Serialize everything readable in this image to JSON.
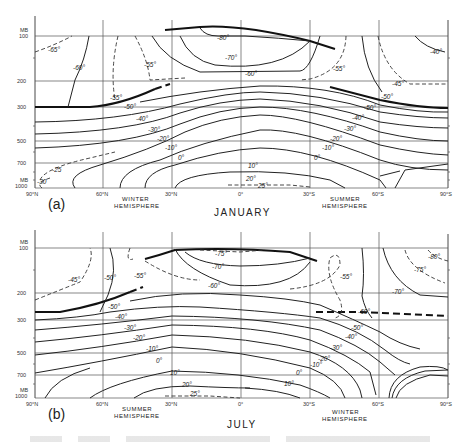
{
  "figure": {
    "type": "meridional temperature cross-section",
    "panels": [
      {
        "id": "a",
        "panel_label": "(a)",
        "month": "JANUARY",
        "left_hemisphere_label": [
          "WINTER",
          "HEMISPHERE"
        ],
        "right_hemisphere_label": [
          "SUMMER",
          "HEMISPHERE"
        ],
        "pressure_unit": "MB",
        "pressure_ticks": [
          "100",
          "200",
          "300",
          "500",
          "700",
          "1000"
        ],
        "pressure_unit_bottom": "MB",
        "latitude_ticks": [
          "90°N",
          "60°N",
          "30°N",
          "0°",
          "30°S",
          "60°S",
          "90°S"
        ],
        "contour_labels": [
          "-65°",
          "-60°",
          "-55°",
          "-55°",
          "-80°",
          "-70°",
          "-60°",
          "-55°",
          "-40°",
          "-45°",
          "-50°",
          "-50°",
          "-50°",
          "-40°",
          "-30°",
          "-20°",
          "-10°",
          "0°",
          "-25",
          "-30",
          "-40°",
          "-30°",
          "-20°",
          "-10°",
          "0°",
          "10°",
          "20°",
          "25°"
        ]
      },
      {
        "id": "b",
        "panel_label": "(b)",
        "month": "JULY",
        "left_hemisphere_label": [
          "SUMMER",
          "HEMISPHERE"
        ],
        "right_hemisphere_label": [
          "WINTER",
          "HEMISPHERE"
        ],
        "pressure_unit": "MB",
        "pressure_ticks": [
          "100",
          "200",
          "300",
          "500",
          "700",
          "1000"
        ],
        "pressure_unit_bottom": "MB",
        "latitude_ticks": [
          "90°N",
          "60°N",
          "30°N",
          "0°",
          "30°S",
          "60°S",
          "90°S"
        ],
        "contour_labels": [
          "-45°",
          "-50°",
          "-55°",
          "-75°",
          "-70°",
          "-60°",
          "-55°",
          "-80°",
          "-75°",
          "-70°",
          "-60°",
          "-50°",
          "-40°",
          "-30°",
          "-20°",
          "-10°",
          "0°",
          "10°",
          "20°",
          "25°",
          "-50°",
          "-40°",
          "-30°",
          "-20°",
          "-10°",
          "0°",
          "10°"
        ]
      }
    ]
  },
  "labels": {
    "a": {
      "panel": "(a)",
      "month": "JANUARY",
      "hemi_left_1": "WINTER",
      "hemi_left_2": "HEMISPHERE",
      "hemi_right_1": "SUMMER",
      "hemi_right_2": "HEMISPHERE",
      "mb_top": "MB",
      "mb_bottom": "MB",
      "p100": "100",
      "p200": "200",
      "p300": "300",
      "p500": "500",
      "p700": "700",
      "p1000": "1000",
      "lat0": "90°N",
      "lat1": "60°N",
      "lat2": "30°N",
      "lat3": "0°",
      "lat4": "30°S",
      "lat5": "60°S",
      "lat6": "90°S",
      "c_m65": "-65°",
      "c_m60a": "-60°",
      "c_m55a": "-55°",
      "c_m55b": "-55°",
      "c_m80": "-80°",
      "c_m70": "-70°",
      "c_m60b": "-60°",
      "c_m55c": "-55°",
      "c_m40a": "-40°",
      "c_m45": "-45°",
      "c_m50a": "-50°",
      "c_m50b": "-50°",
      "c_m50c": "-50°",
      "c_m40b": "-40°",
      "c_m30a": "-30°",
      "c_m20a": "-20°",
      "c_m10a": "-10°",
      "c_0a": "0°",
      "c_m25": "-25",
      "c_m30s": "-30",
      "c_m40c": "-40°",
      "c_m30b": "-30°",
      "c_m20b": "-20°",
      "c_m10b": "-10°",
      "c_0b": "0°",
      "c_10": "10°",
      "c_20": "20°",
      "c_25": "25°"
    },
    "b": {
      "panel": "(b)",
      "month": "JULY",
      "hemi_left_1": "SUMMER",
      "hemi_left_2": "HEMISPHERE",
      "hemi_right_1": "WINTER",
      "hemi_right_2": "HEMISPHERE",
      "mb_top": "MB",
      "mb_bottom": "MB",
      "p100": "100",
      "p200": "200",
      "p300": "300",
      "p500": "500",
      "p700": "700",
      "p1000": "1000",
      "lat0": "90°N",
      "lat1": "60°N",
      "lat2": "30°N",
      "lat3": "0°",
      "lat4": "30°S",
      "lat5": "60°S",
      "lat6": "90°S",
      "c_m45": "-45°",
      "c_m50a": "-50°",
      "c_m55a": "-55°",
      "c_m75a": "-75°",
      "c_m70a": "-70°",
      "c_m60a": "-60°",
      "c_m55b": "-55°",
      "c_m80": "-80°",
      "c_m75b": "-75°",
      "c_m70b": "-70°",
      "c_m60b": "-60°",
      "c_m50b": "-50°",
      "c_m40a": "-40°",
      "c_m30a": "-30°",
      "c_m20a": "-20°",
      "c_m10a": "-10°",
      "c_0a": "0°",
      "c_10a": "10°",
      "c_20": "20°",
      "c_25": "25°",
      "c_m50c": "-50°",
      "c_m40b": "-40°",
      "c_m30b": "-30°",
      "c_m20b": "-20°",
      "c_m10b": "-10°",
      "c_0b": "0°",
      "c_10b": "10°"
    }
  },
  "caption_visible": "partially cut off / illegible"
}
